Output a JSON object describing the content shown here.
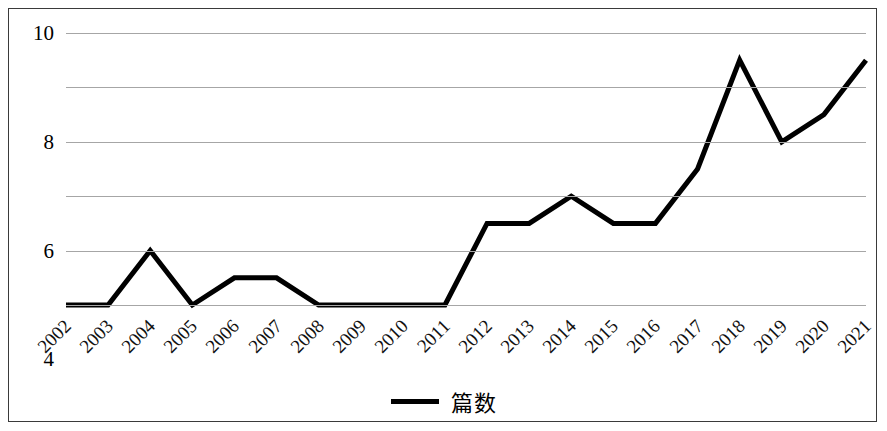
{
  "chart_data": {
    "type": "line",
    "title": "",
    "subtitle": "",
    "xlabel": "",
    "ylabel": "",
    "categories": [
      "2002",
      "2003",
      "2004",
      "2005",
      "2006",
      "2007",
      "2008",
      "2009",
      "2010",
      "2011",
      "2012",
      "2013",
      "2014",
      "2015",
      "2016",
      "2017",
      "2018",
      "2019",
      "2020",
      "2021"
    ],
    "series": [
      {
        "name": "篇数",
        "values": [
          0,
          0,
          2,
          0,
          1,
          1,
          0,
          0,
          0,
          0,
          3,
          3,
          4,
          3,
          3,
          5,
          9,
          6,
          7,
          9
        ],
        "color": "#000000"
      }
    ],
    "ylim": [
      0,
      10
    ],
    "y_ticks": [
      "0",
      "2",
      "4",
      "6",
      "8",
      "10"
    ],
    "y_tick_values": [
      0,
      2,
      4,
      6,
      8,
      10
    ],
    "grid": true,
    "grid_color": "#a6a6a6",
    "legend_position": "bottom-center",
    "legend_entries": [
      "篇数"
    ],
    "frame_border_color": "#3a3a3a",
    "background_color": "#ffffff"
  },
  "legend": {
    "label": "篇数"
  }
}
